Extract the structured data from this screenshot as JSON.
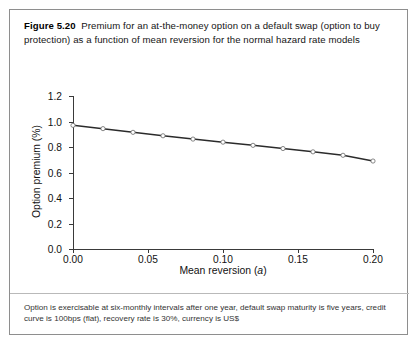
{
  "figure": {
    "label": "Figure 5.20",
    "caption": "Premium for an at-the-money option on a default swap (option to buy protection) as a function of mean reversion for the normal hazard rate models",
    "footnote": "Option is exercisable at six-monthly intervals after one year, default swap maturity is five years, credit curve is 100bps (flat), recovery rate is 30%, currency is US$"
  },
  "axis_labels": {
    "x_prefix": "Mean reversion (",
    "x_italic": "a",
    "x_suffix": ")",
    "y": "Option premium (%)"
  },
  "chart_data": {
    "type": "line",
    "title": "Premium for an at-the-money option on a default swap (option to buy protection) as a function of mean reversion for the normal hazard rate models",
    "xlabel": "Mean reversion (a)",
    "ylabel": "Option premium (%)",
    "xlim": [
      0.0,
      0.2
    ],
    "ylim": [
      0.0,
      1.2
    ],
    "xticks": [
      0.0,
      0.05,
      0.1,
      0.15,
      0.2
    ],
    "xtick_labels": [
      "0.00",
      "0.05",
      "0.10",
      "0.15",
      "0.20"
    ],
    "yticks": [
      0.0,
      0.2,
      0.4,
      0.6,
      0.8,
      1.0,
      1.2
    ],
    "ytick_labels": [
      "0.0",
      "0.2",
      "0.4",
      "0.6",
      "0.8",
      "1.0",
      "1.2"
    ],
    "grid": false,
    "legend": false,
    "marker": "open-circle",
    "line_color": "#2b2b2b",
    "marker_face_color": "#ffffff",
    "series": [
      {
        "name": "Option premium",
        "x": [
          0.0,
          0.02,
          0.04,
          0.06,
          0.08,
          0.1,
          0.12,
          0.14,
          0.16,
          0.18,
          0.2
        ],
        "values": [
          0.97,
          0.944,
          0.915,
          0.888,
          0.862,
          0.838,
          0.813,
          0.788,
          0.762,
          0.735,
          0.69
        ]
      }
    ]
  }
}
